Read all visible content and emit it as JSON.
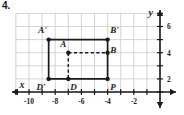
{
  "problem": {
    "number": "4."
  },
  "colors": {
    "grid": "#c9c9c9",
    "axis": "#1a1a1a",
    "shape": "#1a1a1a",
    "background": "#ffffff"
  },
  "chart_data": {
    "type": "scatter",
    "title": "",
    "xlabel": "x",
    "ylabel": "y",
    "xlim": [
      -11.5,
      0.5
    ],
    "ylim": [
      0.3,
      7.3
    ],
    "grid": true,
    "legend": null,
    "xticks": [
      -10,
      -8,
      -6,
      -4,
      -2
    ],
    "xtick_labels": [
      "-10",
      "-8",
      "-6",
      "-4",
      "-2"
    ],
    "yticks": [
      2,
      4,
      6
    ],
    "ytick_labels": [
      "2",
      "4",
      "6"
    ],
    "points": [
      {
        "label": "A'",
        "x": -8.5,
        "y": 5,
        "label_dx": -0.15,
        "label_dy": 0.75,
        "label_anchor": "end"
      },
      {
        "label": "B'",
        "x": -4,
        "y": 5,
        "label_dx": 0.2,
        "label_dy": 0.75,
        "label_anchor": "start"
      },
      {
        "label": "D'",
        "x": -8.5,
        "y": 2,
        "label_dx": -0.25,
        "label_dy": -0.65,
        "label_anchor": "end"
      },
      {
        "label": "P",
        "x": -4,
        "y": 2,
        "label_dx": 0.2,
        "label_dy": -0.65,
        "label_anchor": "start"
      },
      {
        "label": "A",
        "x": -7,
        "y": 4,
        "label_dx": -0.15,
        "label_dy": 0.7,
        "label_anchor": "end"
      },
      {
        "label": "B",
        "x": -4,
        "y": 4,
        "label_dx": 0.2,
        "label_dy": 0.2,
        "label_anchor": "start"
      },
      {
        "label": "D",
        "x": -7,
        "y": 2,
        "label_dx": 0.15,
        "label_dy": -0.65,
        "label_anchor": "start"
      }
    ],
    "solid_path": [
      {
        "x": -8.5,
        "y": 5
      },
      {
        "x": -4,
        "y": 5
      },
      {
        "x": -4,
        "y": 2
      },
      {
        "x": -8.5,
        "y": 2
      },
      {
        "x": -8.5,
        "y": 5
      }
    ],
    "dashed_segments": [
      {
        "x1": -7,
        "y1": 4,
        "x2": -4,
        "y2": 4
      },
      {
        "x1": -7,
        "y1": 4,
        "x2": -7,
        "y2": 2
      }
    ],
    "annotations": [
      "Solid rectangle A'B'PD' is the image of dashed figure ABD"
    ]
  }
}
